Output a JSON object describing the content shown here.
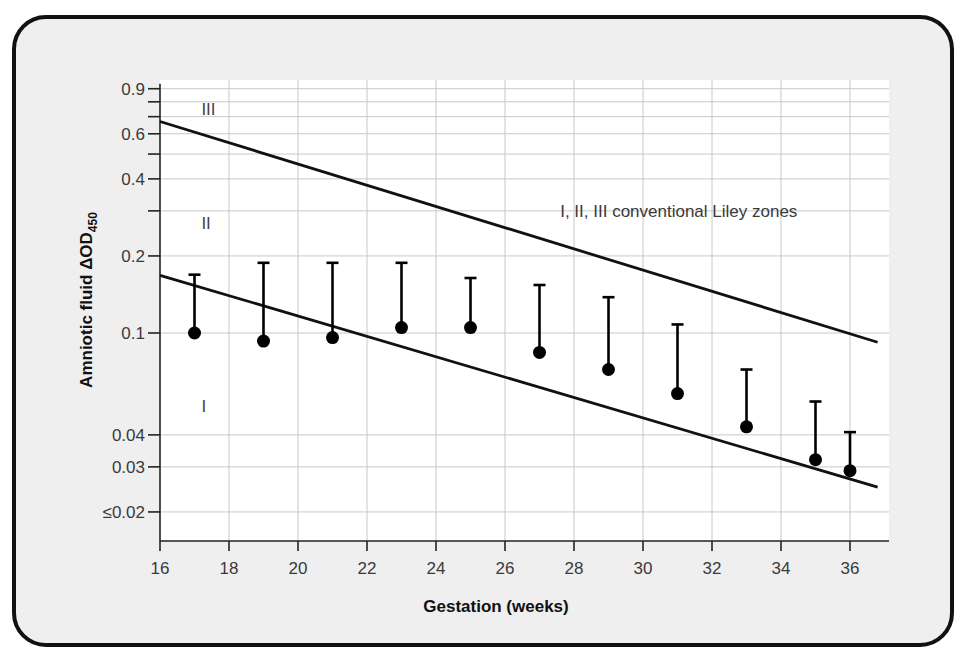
{
  "chart_data": {
    "type": "scatter",
    "title": "",
    "xlabel": "Gestation (weeks)",
    "ylabel": "Amniotic fluid ΔOD",
    "ylabel_subscript": "450",
    "y_scale": "log",
    "xlim": [
      16,
      37
    ],
    "ylim": [
      0.016,
      0.95
    ],
    "grid": true,
    "x_ticks": [
      16,
      18,
      20,
      22,
      24,
      26,
      28,
      30,
      32,
      34,
      36
    ],
    "y_ticks": [
      {
        "value": 0.9,
        "label": "0.9"
      },
      {
        "value": 0.6,
        "label": "0.6"
      },
      {
        "value": 0.4,
        "label": "0.4"
      },
      {
        "value": 0.2,
        "label": "0.2"
      },
      {
        "value": 0.1,
        "label": "0.1"
      },
      {
        "value": 0.04,
        "label": "0.04"
      },
      {
        "value": 0.03,
        "label": "0.03"
      },
      {
        "value": 0.02,
        "label": "≤0.02"
      }
    ],
    "y_minor_ticks": [
      0.8,
      0.7,
      0.5,
      0.3
    ],
    "series": [
      {
        "name": "Mean ΔOD450",
        "marker": "filled-circle",
        "x": [
          17,
          19,
          21,
          23,
          25,
          27,
          29,
          31,
          33,
          35,
          36
        ],
        "y": [
          0.1,
          0.093,
          0.096,
          0.105,
          0.105,
          0.084,
          0.072,
          0.058,
          0.043,
          0.032,
          0.029
        ],
        "upper": [
          0.169,
          0.188,
          0.188,
          0.188,
          0.164,
          0.154,
          0.138,
          0.108,
          0.072,
          0.054,
          0.041
        ]
      }
    ],
    "reference_lines": [
      {
        "name": "Zone II/III boundary",
        "x": [
          16,
          36.8
        ],
        "y": [
          0.67,
          0.092
        ]
      },
      {
        "name": "Zone I/II boundary",
        "x": [
          16,
          36.8
        ],
        "y": [
          0.168,
          0.025
        ]
      }
    ],
    "zone_labels": [
      {
        "label": "III",
        "x": 17.2,
        "y": 0.75
      },
      {
        "label": "II",
        "x": 17.2,
        "y": 0.27
      },
      {
        "label": "I",
        "x": 17.2,
        "y": 0.052
      }
    ],
    "annotations": [
      {
        "text": "I, II, III conventional Liley zones",
        "x": 27.6,
        "y": 0.3
      }
    ]
  },
  "colors": {
    "background": "#efefef",
    "plot_area": "#ffffff",
    "grid": "#c8c8c8",
    "lines": "#111111",
    "markers": "#000000"
  }
}
